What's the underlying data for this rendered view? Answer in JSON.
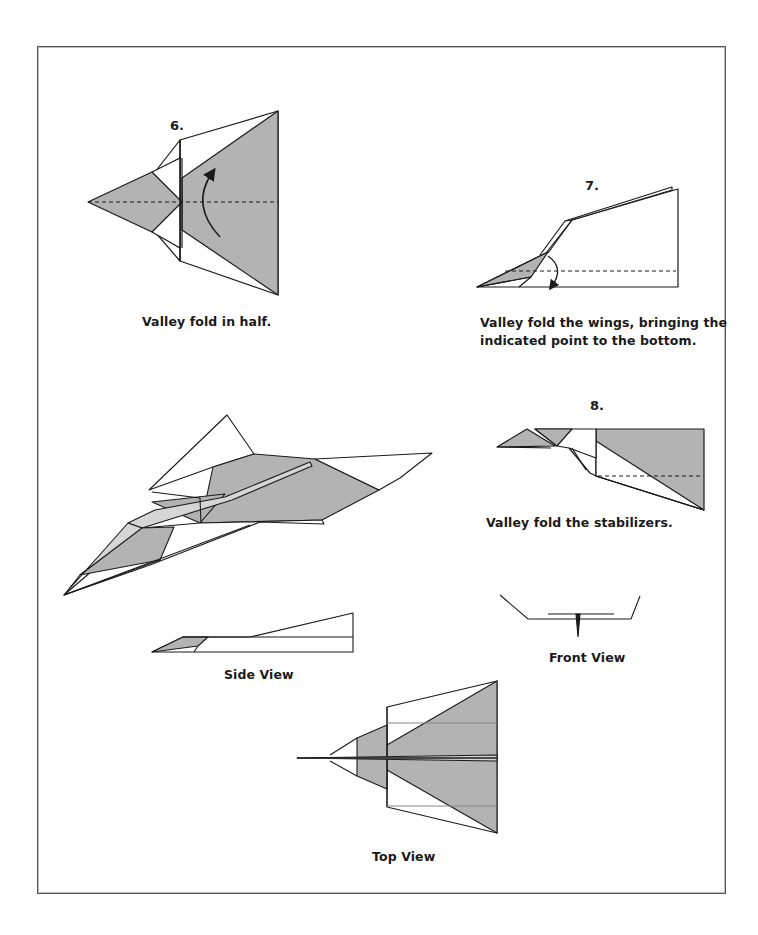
{
  "colors": {
    "shade": "#b3b3b3",
    "light_shade": "#d6d6d6",
    "line": "#1a1a1a",
    "frame": "#555555"
  },
  "steps": [
    {
      "number": "6.",
      "caption": "Valley fold in half."
    },
    {
      "number": "7.",
      "caption_line1": "Valley fold the wings, bringing the",
      "caption_line2": "indicated point to the bottom."
    },
    {
      "number": "8.",
      "caption": "Valley fold the stabilizers."
    }
  ],
  "views": {
    "side": "Side View",
    "front": "Front View",
    "top": "Top View"
  }
}
